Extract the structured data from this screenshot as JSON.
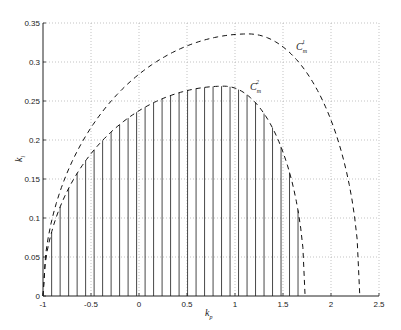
{
  "chart_data": {
    "type": "line",
    "title": "",
    "xlabel": "k_p",
    "ylabel": "k_i",
    "xlim": [
      -1,
      2.5
    ],
    "ylim": [
      0,
      0.35
    ],
    "grid": true,
    "xticks": [
      -1,
      -0.5,
      0,
      0.5,
      1,
      1.5,
      2,
      2.5
    ],
    "xtick_labels": [
      "-1",
      "-0.5",
      "0",
      "0.5",
      "1",
      "1.5",
      "2",
      "2.5"
    ],
    "yticks": [
      0,
      0.05,
      0.1,
      0.15,
      0.2,
      0.25,
      0.3,
      0.35
    ],
    "ytick_labels": [
      "0",
      "0.05",
      "0.1",
      "0.15",
      "0.2",
      "0.25",
      "0.3",
      "0.35"
    ],
    "series": [
      {
        "name": "C_m^1",
        "style": "dashed",
        "x_start": -1,
        "x_end": 2.3,
        "peak": [
          1.14,
          0.336
        ],
        "x": [
          -1,
          -0.5,
          0,
          0.5,
          1,
          1.14,
          1.5,
          2,
          2.3
        ],
        "y": [
          0,
          0.13,
          0.222,
          0.292,
          0.333,
          0.336,
          0.322,
          0.215,
          0
        ]
      },
      {
        "name": "C_m^2",
        "style": "dashed",
        "x_start": -1,
        "x_end": 1.73,
        "peak": [
          0.885,
          0.269
        ],
        "x": [
          -1,
          -0.5,
          0,
          0.5,
          0.885,
          1,
          1.5,
          1.73
        ],
        "y": [
          0,
          0.113,
          0.193,
          0.248,
          0.269,
          0.267,
          0.175,
          0
        ]
      }
    ],
    "hatch": {
      "description": "vertical lines filling the stable region under C_m^2",
      "x_start": -0.91,
      "spacing": 0.0885,
      "count": 30
    },
    "annotations": [
      {
        "text": "C",
        "sub": "m",
        "sup": "1",
        "x": 1.85,
        "y": 0.315
      },
      {
        "text": "C",
        "sub": "m",
        "sup": "2",
        "x": 1.05,
        "y": 0.262
      }
    ]
  },
  "labels": {
    "xlabel_main": "k",
    "xlabel_sub": "p",
    "ylabel_main": "k",
    "ylabel_sub": "i",
    "c1_main": "C",
    "c1_sub": "m",
    "c1_sup": "1",
    "c2_main": "C",
    "c2_sub": "m",
    "c2_sup": "2"
  },
  "plot_area": {
    "left": 43,
    "right": 379,
    "top": 23,
    "bottom": 296
  }
}
